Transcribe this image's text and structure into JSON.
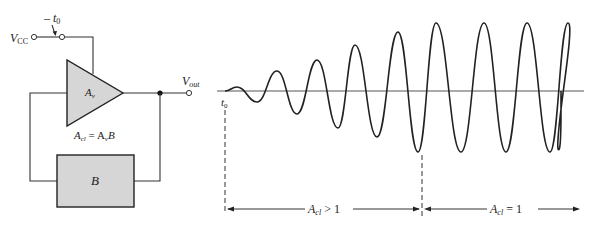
{
  "circuit": {
    "supply_label": "V",
    "supply_sub": "CC",
    "switch_label": "t",
    "switch_sub": "0",
    "amplifier_label": "A",
    "amplifier_sub": "v",
    "output_label": "V",
    "output_sub": "out",
    "gain_equation": {
      "lhs": "A",
      "lhs_sub": "cl",
      "eq": " = A",
      "rhs_sub": "v",
      "rhs_tail": "B"
    },
    "feedback_label": "B",
    "fill_color": "#d6d6d6"
  },
  "waveform": {
    "start_label": "t",
    "start_sub": "0",
    "region_growth": {
      "label": "A",
      "sub": "cl",
      "relation": " > 1"
    },
    "region_steady": {
      "label": "A",
      "sub": "cl",
      "relation": " = 1"
    },
    "peaks": [
      [
        237,
        87
      ],
      [
        277,
        71
      ],
      [
        317,
        60
      ],
      [
        355,
        45
      ],
      [
        398,
        32
      ],
      [
        436,
        23
      ],
      [
        484,
        23
      ],
      [
        527,
        23
      ],
      [
        568,
        23
      ]
    ],
    "troughs": [
      [
        257,
        102
      ],
      [
        297,
        114
      ],
      [
        338,
        128
      ],
      [
        377,
        137
      ],
      [
        418,
        152
      ],
      [
        461,
        152
      ],
      [
        506,
        152
      ],
      [
        550,
        152
      ]
    ]
  }
}
